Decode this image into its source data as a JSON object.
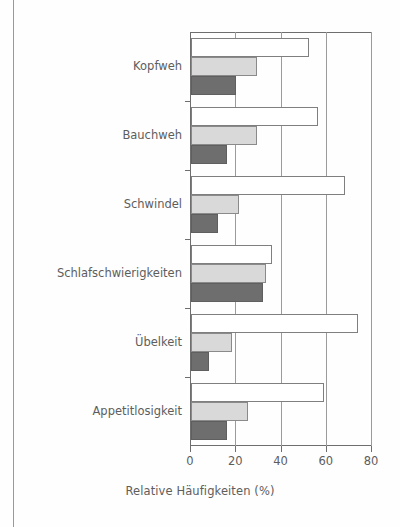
{
  "chart_data": {
    "type": "bar",
    "orientation": "horizontal",
    "title": "",
    "xlabel": "Relative Häufigkeiten (%)",
    "ylabel": "",
    "xlim": [
      0,
      80
    ],
    "xticks": [
      0,
      20,
      40,
      60,
      80
    ],
    "xticklabels": [
      "0",
      "20",
      "40",
      "60",
      "80"
    ],
    "grid": "vertical",
    "legend": "none",
    "categories": [
      "Kopfweh",
      "Bauchweh",
      "Schwindel",
      "Schlafschwierigkeiten",
      "Übelkeit",
      "Appetitlosigkeit"
    ],
    "series": [
      {
        "name": "series-1",
        "color": "#ffffff",
        "values": [
          52,
          56,
          68,
          36,
          74,
          59
        ]
      },
      {
        "name": "series-2",
        "color": "#d9d9d9",
        "values": [
          29,
          29,
          21,
          33,
          18,
          25
        ]
      },
      {
        "name": "series-3",
        "color": "#6e6e6e",
        "values": [
          20,
          16,
          12,
          32,
          8,
          16
        ]
      }
    ]
  },
  "axis": {
    "x_title": "Relative Häufigkeiten (%)",
    "tick_0": "0",
    "tick_20": "20",
    "tick_40": "40",
    "tick_60": "60",
    "tick_80": "80"
  },
  "categories": {
    "c0": "Kopfweh",
    "c1": "Bauchweh",
    "c2": "Schwindel",
    "c3": "Schlafschwierigkeiten",
    "c4": "Übelkeit",
    "c5": "Appetitlosigkeit"
  },
  "colors": {
    "series_1": "#ffffff",
    "series_2": "#d9d9d9",
    "series_3": "#6e6e6e",
    "axis": "#6e6e6e",
    "grid": "#9b9b9b",
    "text": "#5d5d5d"
  }
}
